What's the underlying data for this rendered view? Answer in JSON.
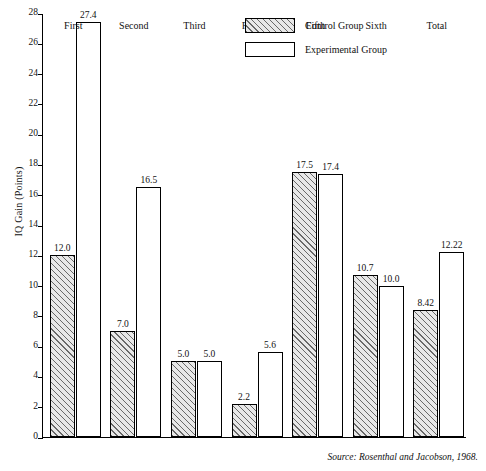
{
  "chart_data": {
    "type": "bar",
    "title": "",
    "xlabel": "",
    "ylabel": "IQ Gain (Points)",
    "ylim": [
      0,
      28
    ],
    "ytick_step": 2,
    "yticks": [
      "0",
      "2",
      "4",
      "6",
      "8",
      "10",
      "12",
      "14",
      "16",
      "18",
      "20",
      "22",
      "24",
      "26",
      "28"
    ],
    "grid": false,
    "legend_position": "top-right",
    "categories": [
      "First",
      "Second",
      "Third",
      "Fourth",
      "Fifth",
      "Sixth",
      "Total"
    ],
    "series": [
      {
        "name": "Control Group",
        "values": [
          12.0,
          7.0,
          5.0,
          2.2,
          17.5,
          10.7,
          8.42
        ],
        "labels": [
          "12.0",
          "7.0",
          "5.0",
          "2.2",
          "17.5",
          "10.7",
          "8.42"
        ]
      },
      {
        "name": "Experimental Group",
        "values": [
          27.4,
          16.5,
          5.0,
          5.6,
          17.4,
          10.0,
          12.22
        ],
        "labels": [
          "27.4",
          "16.5",
          "5.0",
          "5.6",
          "17.4",
          "10.0",
          "12.22"
        ]
      }
    ],
    "annotations": [
      "Source: Rosenthal and Jacobson, 1968."
    ]
  },
  "legend": {
    "items": [
      {
        "label": "Control Group",
        "style": "hatched"
      },
      {
        "label": "Experimental Group",
        "style": "open"
      }
    ]
  },
  "source_note": "Source: Rosenthal and Jacobson, 1968.",
  "colors": {
    "axis": "#000000",
    "bar_control_fill": "#e8e8e8",
    "bar_experimental_fill": "#ffffff",
    "text": "#111111"
  }
}
